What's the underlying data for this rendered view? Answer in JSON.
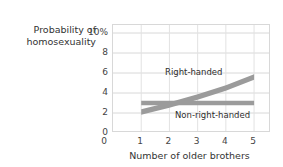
{
  "chart_data": {
    "type": "line",
    "title": "",
    "xlabel": "Number of older brothers",
    "ylabel": "Probability of\nhomosexuality",
    "x": [
      1,
      2,
      3,
      4,
      5
    ],
    "xlim": [
      0,
      5.6
    ],
    "ylim": [
      0,
      10.8
    ],
    "xticks": [
      "0",
      "1",
      "2",
      "3",
      "4",
      "5"
    ],
    "yticks": [
      "10%",
      "8",
      "6",
      "4",
      "2",
      "0"
    ],
    "ytick_values": [
      10,
      8,
      6,
      4,
      2,
      0
    ],
    "grid": true,
    "legend_position": "inline-annotations",
    "band_color": "#9b9b9b",
    "series": [
      {
        "name": "Right-handed",
        "values": [
          2.1,
          2.8,
          3.6,
          4.5,
          5.6
        ],
        "band_half_width": 0.28,
        "label": "Right-handed"
      },
      {
        "name": "Non-right-handed",
        "values": [
          3.0,
          3.0,
          3.0,
          3.0,
          3.0
        ],
        "band_half_width": 0.22,
        "label": "Non-right-handed"
      }
    ]
  },
  "axes": {
    "y_title": "Probability of\nhomosexuality",
    "x_title": "Number of older brothers",
    "x_origin_label": "0"
  },
  "colors": {
    "band": "#9b9b9b",
    "grid": "#d8d8d8",
    "border": "#d8d8d8",
    "text": "#333333",
    "background": "#ffffff"
  }
}
